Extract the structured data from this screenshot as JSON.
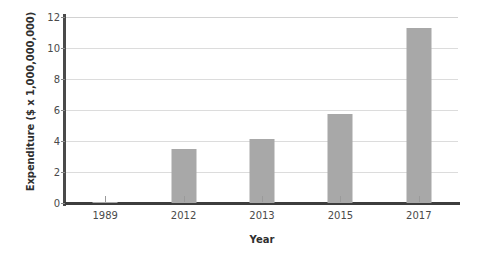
{
  "chart_data": {
    "type": "bar",
    "title": "",
    "xlabel": "Year",
    "ylabel": "Expenditure ($ x 1,000,000,000)",
    "categories": [
      "1989",
      "2012",
      "2013",
      "2015",
      "2017"
    ],
    "values": [
      0.05,
      3.5,
      4.1,
      5.75,
      11.3
    ],
    "series": [
      {
        "name": "Expenditure",
        "values": [
          0.05,
          3.5,
          4.1,
          5.75,
          11.3
        ]
      }
    ],
    "ylim": [
      0,
      12
    ],
    "ytick_values": [
      0,
      2,
      4,
      6,
      8,
      10,
      12
    ],
    "ytick_labels": [
      "0",
      "2",
      "4",
      "6",
      "8",
      "10",
      "12"
    ],
    "grid": "horizontal",
    "legend": "none",
    "bar_color": "#a8a8a8",
    "gridline_color": "#dcdcdc",
    "axis_color": "#3d3d3d",
    "background_color": "#ffffff"
  }
}
